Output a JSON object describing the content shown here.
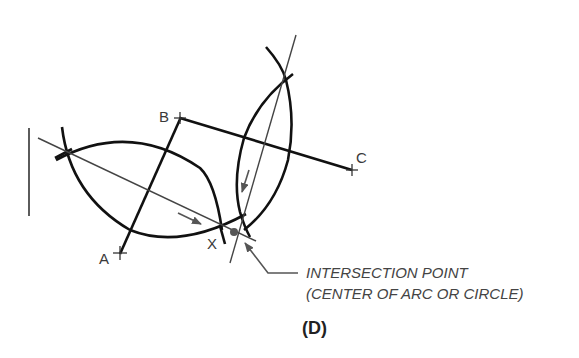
{
  "diagram": {
    "points": {
      "A": {
        "label": "A",
        "x": 120,
        "y": 253
      },
      "B": {
        "label": "B",
        "x": 180,
        "y": 118
      },
      "C": {
        "label": "C",
        "x": 352,
        "y": 169
      },
      "X": {
        "label": "X"
      }
    },
    "callout": {
      "line1": "INTERSECTION POINT",
      "line2": "(CENTER OF ARC OR CIRCLE)"
    },
    "caption": "(D)",
    "colors": {
      "thick_line": "#111111",
      "thin_line": "#444444",
      "text": "#3a3a3a",
      "background": "#ffffff"
    }
  }
}
